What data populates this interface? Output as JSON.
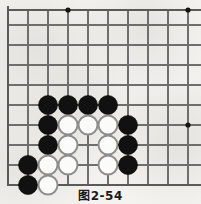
{
  "figure": {
    "caption": "图2-54",
    "kind": "go-board-diagram"
  },
  "board": {
    "line_color": "#6e6e6e",
    "edge_color": "#5a5a5a",
    "background_color": "#f2f1ee",
    "black_stone_color": "#111111",
    "white_stone_color": "#fbfbf9",
    "white_stone_border_color": "#8d8d8d",
    "grid_spacing": 20,
    "origin_x": 8,
    "origin_y": 10,
    "columns": 10,
    "rows": 10,
    "x_lines": [
      8,
      28,
      48,
      68,
      88,
      108,
      128,
      148,
      168,
      188
    ],
    "y_lines": [
      10,
      25,
      45,
      65,
      85,
      105,
      125,
      145,
      165,
      185
    ],
    "edges": {
      "left": 8,
      "top": 10,
      "bottom": 185,
      "right_open": true
    },
    "star_points": [
      {
        "x": 68,
        "y": 10
      },
      {
        "x": 188,
        "y": 10
      },
      {
        "x": 188,
        "y": 125
      }
    ],
    "stone_radius": 9.5,
    "stones": [
      {
        "color": "black",
        "x": 48,
        "y": 105
      },
      {
        "color": "black",
        "x": 68,
        "y": 105
      },
      {
        "color": "black",
        "x": 88,
        "y": 105
      },
      {
        "color": "black",
        "x": 108,
        "y": 105
      },
      {
        "color": "black",
        "x": 48,
        "y": 125
      },
      {
        "color": "white",
        "x": 68,
        "y": 125
      },
      {
        "color": "white",
        "x": 88,
        "y": 125
      },
      {
        "color": "white",
        "x": 108,
        "y": 125
      },
      {
        "color": "black",
        "x": 128,
        "y": 125
      },
      {
        "color": "black",
        "x": 48,
        "y": 145
      },
      {
        "color": "white",
        "x": 68,
        "y": 145
      },
      {
        "color": "white",
        "x": 108,
        "y": 145
      },
      {
        "color": "black",
        "x": 128,
        "y": 145
      },
      {
        "color": "black",
        "x": 28,
        "y": 165
      },
      {
        "color": "white",
        "x": 48,
        "y": 165
      },
      {
        "color": "white",
        "x": 68,
        "y": 165
      },
      {
        "color": "white",
        "x": 108,
        "y": 165
      },
      {
        "color": "black",
        "x": 128,
        "y": 165
      },
      {
        "color": "black",
        "x": 28,
        "y": 185
      },
      {
        "color": "white",
        "x": 48,
        "y": 185
      }
    ]
  }
}
